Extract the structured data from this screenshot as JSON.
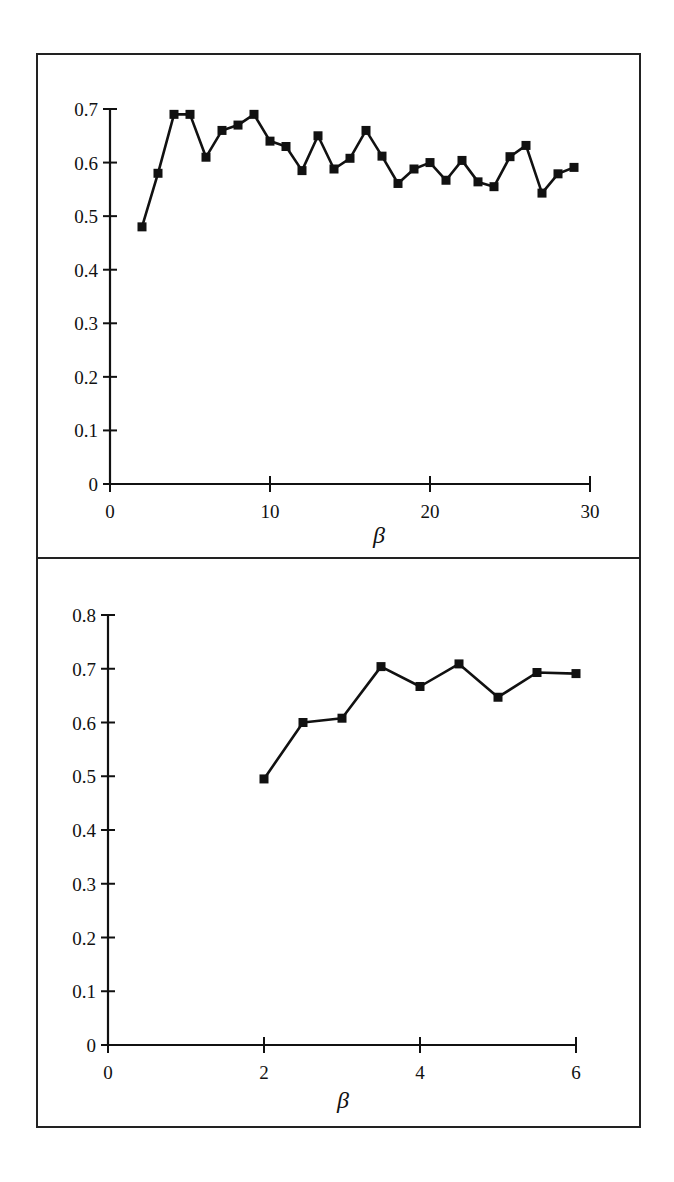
{
  "figure": {
    "panels": [
      {
        "id": "top",
        "xlabel": "β",
        "x_ticks": [
          "0",
          "10",
          "20",
          "30"
        ],
        "y_ticks": [
          "0",
          "0.1",
          "0.2",
          "0.3",
          "0.4",
          "0.5",
          "0.6",
          "0.7"
        ]
      },
      {
        "id": "bottom",
        "xlabel": "β",
        "x_ticks": [
          "0",
          "2",
          "4",
          "6"
        ],
        "y_ticks": [
          "0",
          "0.1",
          "0.2",
          "0.3",
          "0.4",
          "0.5",
          "0.6",
          "0.7",
          "0.8"
        ]
      }
    ],
    "colors": {
      "line": "#111111",
      "marker": "#111111",
      "frame": "#222222",
      "background": "#ffffff"
    }
  },
  "chart_data": [
    {
      "type": "line",
      "title": "",
      "xlabel": "β",
      "ylabel": "",
      "xlim": [
        0,
        30
      ],
      "ylim": [
        0,
        0.7
      ],
      "x_ticks": [
        0,
        10,
        20,
        30
      ],
      "y_ticks": [
        0,
        0.1,
        0.2,
        0.3,
        0.4,
        0.5,
        0.6,
        0.7
      ],
      "grid": false,
      "legend": null,
      "marker": "square",
      "series": [
        {
          "name": "series-1",
          "x": [
            2,
            3,
            4,
            5,
            6,
            7,
            8,
            9,
            10,
            11,
            12,
            13,
            14,
            15,
            16,
            17,
            18,
            19,
            20,
            21,
            22,
            23,
            24,
            25,
            26,
            27,
            28,
            29
          ],
          "values": [
            0.48,
            0.58,
            0.69,
            0.69,
            0.61,
            0.66,
            0.67,
            0.69,
            0.64,
            0.63,
            0.585,
            0.65,
            0.588,
            0.608,
            0.66,
            0.612,
            0.561,
            0.588,
            0.6,
            0.567,
            0.604,
            0.564,
            0.555,
            0.611,
            0.632,
            0.543,
            0.579,
            0.591
          ]
        }
      ]
    },
    {
      "type": "line",
      "title": "",
      "xlabel": "β",
      "ylabel": "",
      "xlim": [
        0,
        6
      ],
      "ylim": [
        0,
        0.8
      ],
      "x_ticks": [
        0,
        2,
        4,
        6
      ],
      "y_ticks": [
        0,
        0.1,
        0.2,
        0.3,
        0.4,
        0.5,
        0.6,
        0.7,
        0.8
      ],
      "grid": false,
      "legend": null,
      "marker": "square",
      "series": [
        {
          "name": "series-1",
          "x": [
            2.0,
            2.5,
            3.0,
            3.5,
            4.0,
            4.5,
            5.0,
            5.5,
            6.0
          ],
          "values": [
            0.495,
            0.6,
            0.608,
            0.704,
            0.667,
            0.709,
            0.647,
            0.693,
            0.691
          ]
        }
      ]
    }
  ]
}
